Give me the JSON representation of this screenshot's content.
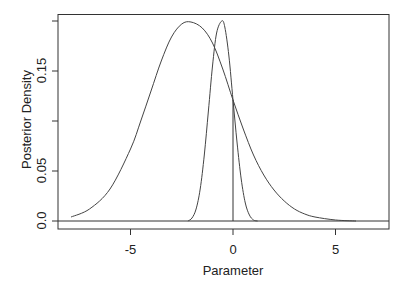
{
  "chart_data": {
    "type": "line",
    "title": "",
    "xlabel": "Parameter",
    "ylabel": "Posterior Density",
    "xlim": [
      -8.3,
      7.5
    ],
    "ylim": [
      -0.008,
      0.208
    ],
    "x_ticks": [
      -5,
      0,
      5
    ],
    "x_tick_labels": [
      "-5",
      "0",
      "5"
    ],
    "y_ticks": [
      0.0,
      0.05,
      0.1,
      0.15,
      0.2
    ],
    "y_tick_labels": [
      "0.0",
      "0.05",
      "",
      "0.15",
      ""
    ],
    "grid": false,
    "legend": null,
    "series": [
      {
        "name": "broad-posterior",
        "x": [
          -7.9,
          -7.0,
          -6.0,
          -5.0,
          -4.5,
          -4.0,
          -3.5,
          -3.0,
          -2.5,
          -2.05,
          -1.5,
          -1.0,
          -0.5,
          0.0,
          0.5,
          1.0,
          1.5,
          2.0,
          2.5,
          3.0,
          3.5,
          4.0,
          5.0,
          6.0
        ],
        "y": [
          0.004,
          0.012,
          0.032,
          0.072,
          0.1,
          0.13,
          0.16,
          0.184,
          0.197,
          0.199,
          0.193,
          0.178,
          0.152,
          0.121,
          0.092,
          0.066,
          0.046,
          0.031,
          0.02,
          0.012,
          0.007,
          0.004,
          0.001,
          0.0
        ]
      },
      {
        "name": "narrow-posterior",
        "x": [
          -2.2,
          -2.0,
          -1.8,
          -1.6,
          -1.4,
          -1.2,
          -1.0,
          -0.8,
          -0.55,
          -0.4,
          -0.2,
          0.0,
          0.2,
          0.4,
          0.6,
          0.8,
          1.0,
          1.2
        ],
        "y": [
          0.0,
          0.003,
          0.012,
          0.032,
          0.066,
          0.11,
          0.155,
          0.188,
          0.2,
          0.194,
          0.165,
          0.121,
          0.078,
          0.042,
          0.018,
          0.006,
          0.001,
          0.0
        ]
      }
    ],
    "annotations": [
      {
        "type": "vline",
        "x": 0,
        "y_from": 0.0,
        "y_to": 0.121
      },
      {
        "type": "hline",
        "y": 0.0
      }
    ]
  }
}
